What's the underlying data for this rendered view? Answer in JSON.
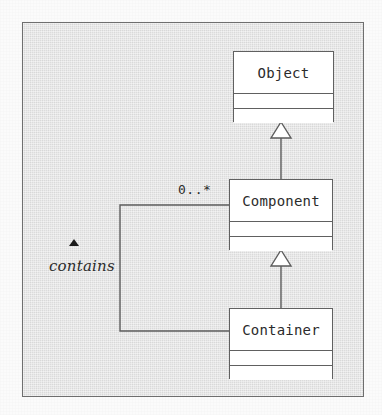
{
  "diagram": {
    "type": "uml-class-diagram",
    "frame": {
      "border_color": "#6f6f6f",
      "fill_color": "#e4e4e4"
    },
    "classes": [
      {
        "id": "object",
        "name": "Object",
        "attributes": [],
        "operations": []
      },
      {
        "id": "component",
        "name": "Component",
        "attributes": [],
        "operations": []
      },
      {
        "id": "container",
        "name": "Container",
        "attributes": [],
        "operations": []
      }
    ],
    "relationships": [
      {
        "id": "gen-component-object",
        "kind": "generalization",
        "from": "Component",
        "to": "Object",
        "arrow": "hollow-triangle"
      },
      {
        "id": "gen-container-component",
        "kind": "generalization",
        "from": "Container",
        "to": "Component",
        "arrow": "hollow-triangle"
      },
      {
        "id": "assoc-container-component",
        "kind": "association",
        "from": "Container",
        "to": "Component",
        "label": "contains",
        "label_style": "italic",
        "navigation_marker": "solid-triangle-up",
        "multiplicity_target": "0..*"
      }
    ],
    "labels": {
      "multiplicity": "0..*",
      "association_name": "contains"
    },
    "colors": {
      "class_fill": "#ffffff",
      "line": "#5c5c5c",
      "text": "#2b2b2b",
      "marker": "#1b1b1b"
    }
  }
}
